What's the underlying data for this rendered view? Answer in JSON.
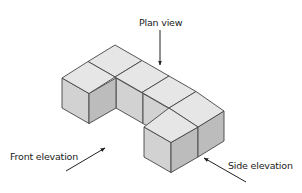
{
  "diagram": {
    "cubes": 6,
    "labels": {
      "plan_view": "Plan view",
      "front_elevation": "Front elevation",
      "side_elevation": "Side elevation"
    },
    "colors": {
      "top_face": "#e6e6e6",
      "left_face": "#d2d2d2",
      "right_face": "#bcbcbc",
      "edge": "#444444",
      "arrow": "#222222"
    }
  }
}
